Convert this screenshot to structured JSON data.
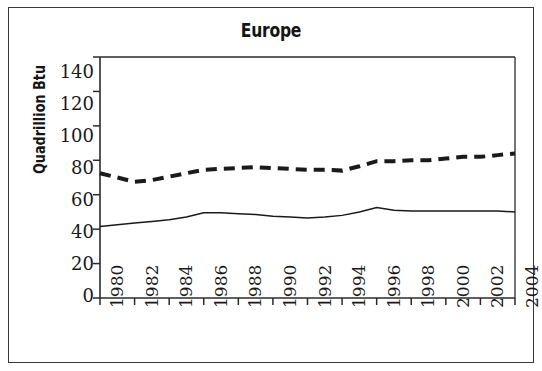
{
  "chart_data": {
    "type": "line",
    "title": "Europe",
    "xlabel": "",
    "ylabel": "Quadrillion Btu",
    "xlim": [
      1980,
      2004
    ],
    "ylim": [
      0,
      140
    ],
    "ytick_step": 20,
    "xtick_step": 2,
    "grid": false,
    "legend": "none",
    "x": [
      1980,
      1981,
      1982,
      1983,
      1984,
      1985,
      1986,
      1987,
      1988,
      1989,
      1990,
      1991,
      1992,
      1993,
      1994,
      1995,
      1996,
      1997,
      1998,
      1999,
      2000,
      2001,
      2002,
      2003,
      2004
    ],
    "series": [
      {
        "name": "Consumption",
        "style": "dashed",
        "color": "#1a1a1a",
        "line_width": 4,
        "values": [
          72.5,
          70.0,
          67.5,
          68.5,
          70.5,
          72.5,
          74.5,
          75.0,
          75.5,
          76.0,
          75.5,
          75.0,
          74.5,
          74.5,
          74.0,
          76.5,
          79.5,
          79.5,
          80.0,
          80.0,
          81.0,
          82.0,
          82.0,
          83.0,
          84.0
        ]
      },
      {
        "name": "Production",
        "style": "solid",
        "color": "#1a1a1a",
        "line_width": 1.5,
        "values": [
          41.5,
          42.5,
          43.5,
          44.5,
          45.5,
          47.0,
          49.5,
          49.5,
          49.0,
          48.5,
          47.5,
          47.0,
          46.5,
          47.0,
          48.0,
          50.0,
          52.5,
          51.0,
          50.5,
          50.5,
          50.5,
          50.5,
          50.5,
          50.5,
          50.0
        ]
      }
    ],
    "ytick_labels": [
      "140",
      "120",
      "100",
      "80",
      "60",
      "40",
      "20",
      "0"
    ],
    "xtick_labels": [
      "1980",
      "1982",
      "1984",
      "1986",
      "1988",
      "1990",
      "1992",
      "1994",
      "1996",
      "1998",
      "2000",
      "2002",
      "2004"
    ]
  },
  "colors": {
    "axis": "#2b2b2b",
    "frame": "#3a3a3a",
    "text": "#151515",
    "background": "#ffffff"
  }
}
